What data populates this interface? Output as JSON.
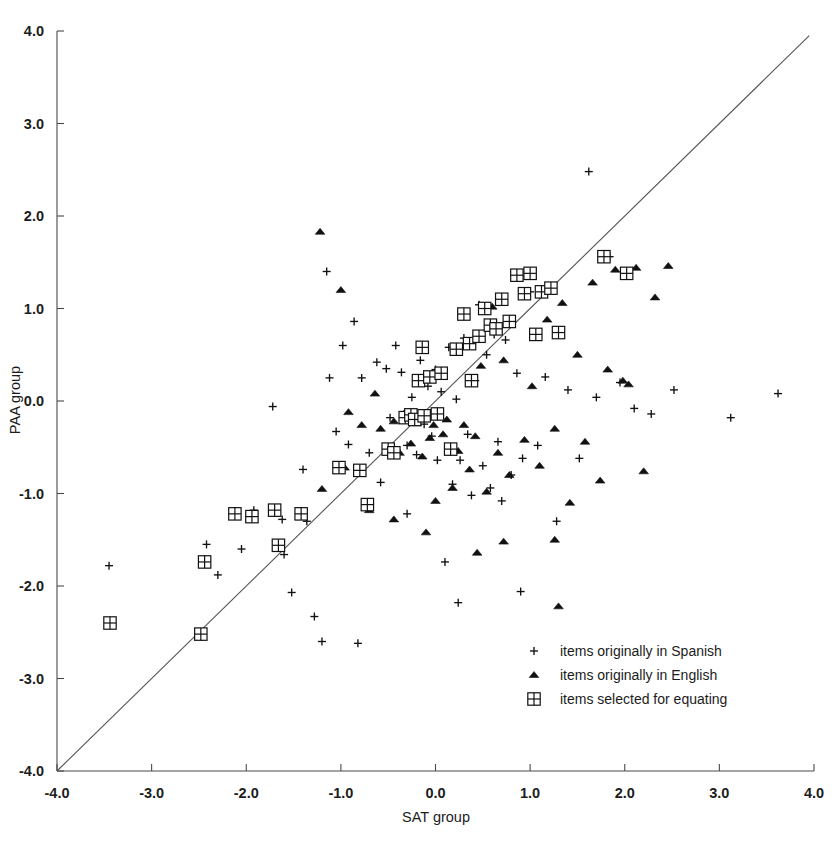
{
  "chart_data": {
    "type": "scatter",
    "title": "",
    "xlabel": "SAT group",
    "ylabel": "PAA group",
    "xlim": [
      -4.0,
      4.0
    ],
    "ylim": [
      -4.0,
      4.0
    ],
    "grid": false,
    "xticks": [
      "-4.0",
      "-3.0",
      "-2.0",
      "-1.0",
      "0.0",
      "1.0",
      "2.0",
      "3.0",
      "4.0"
    ],
    "xtick_values": [
      -4,
      -3,
      -2,
      -1,
      0,
      1,
      2,
      3,
      4
    ],
    "yticks": [
      "-4.0",
      "-3.0",
      "-2.0",
      "-1.0",
      "0.0",
      "1.0",
      "2.0",
      "3.0",
      "4.0"
    ],
    "ytick_values": [
      -4,
      -3,
      -2,
      -1,
      0,
      1,
      2,
      3,
      4
    ],
    "reference_line": {
      "name": "identity-line",
      "description": "y = x diagonal reference line",
      "from": [
        -4.0,
        -4.0
      ],
      "to": [
        3.95,
        3.95
      ]
    },
    "legend_position": "lower-right-inside",
    "series": [
      {
        "name": "items originally in Spanish",
        "marker": "plus",
        "points": [
          [
            -3.45,
            -1.78
          ],
          [
            -2.42,
            -1.55
          ],
          [
            -2.3,
            -1.88
          ],
          [
            -2.05,
            -1.6
          ],
          [
            -1.92,
            -1.18
          ],
          [
            -1.72,
            -0.06
          ],
          [
            -1.62,
            -1.28
          ],
          [
            -1.6,
            -1.66
          ],
          [
            -1.52,
            -2.07
          ],
          [
            -1.4,
            -0.74
          ],
          [
            -1.36,
            -1.3
          ],
          [
            -1.28,
            -2.33
          ],
          [
            -1.2,
            -2.6
          ],
          [
            -1.15,
            1.4
          ],
          [
            -1.12,
            0.25
          ],
          [
            -1.05,
            -0.33
          ],
          [
            -0.98,
            0.6
          ],
          [
            -0.92,
            -0.47
          ],
          [
            -0.86,
            0.86
          ],
          [
            -0.82,
            -2.62
          ],
          [
            -0.78,
            0.25
          ],
          [
            -0.7,
            -0.56
          ],
          [
            -0.62,
            0.42
          ],
          [
            -0.58,
            -0.88
          ],
          [
            -0.52,
            0.35
          ],
          [
            -0.48,
            -0.18
          ],
          [
            -0.42,
            0.6
          ],
          [
            -0.36,
            0.31
          ],
          [
            -0.3,
            -0.48
          ],
          [
            -0.25,
            0.04
          ],
          [
            -0.2,
            -0.58
          ],
          [
            -0.16,
            0.44
          ],
          [
            -0.12,
            -0.25
          ],
          [
            -0.08,
            0.16
          ],
          [
            -0.04,
            -0.38
          ],
          [
            0.0,
            0.34
          ],
          [
            0.02,
            -0.64
          ],
          [
            0.06,
            0.1
          ],
          [
            0.1,
            -1.74
          ],
          [
            0.14,
            0.58
          ],
          [
            0.18,
            -0.9
          ],
          [
            0.22,
            0.02
          ],
          [
            0.26,
            -0.64
          ],
          [
            0.3,
            0.68
          ],
          [
            0.34,
            -0.36
          ],
          [
            0.38,
            -1.02
          ],
          [
            0.42,
            0.22
          ],
          [
            0.46,
            1.04
          ],
          [
            0.5,
            -0.7
          ],
          [
            0.54,
            0.5
          ],
          [
            0.58,
            -0.94
          ],
          [
            0.62,
            0.72
          ],
          [
            0.66,
            -0.44
          ],
          [
            0.7,
            -1.08
          ],
          [
            0.74,
            0.66
          ],
          [
            0.8,
            -0.8
          ],
          [
            0.86,
            0.3
          ],
          [
            0.92,
            -0.62
          ],
          [
            1.0,
            1.18
          ],
          [
            1.08,
            -0.48
          ],
          [
            1.16,
            0.26
          ],
          [
            1.28,
            -1.3
          ],
          [
            1.4,
            0.12
          ],
          [
            1.52,
            -0.62
          ],
          [
            1.62,
            2.48
          ],
          [
            1.7,
            0.04
          ],
          [
            1.84,
            1.56
          ],
          [
            1.95,
            0.2
          ],
          [
            2.1,
            -0.08
          ],
          [
            2.28,
            -0.14
          ],
          [
            2.52,
            0.12
          ],
          [
            3.12,
            -0.18
          ],
          [
            3.62,
            0.08
          ],
          [
            0.9,
            -2.06
          ],
          [
            0.24,
            -2.18
          ],
          [
            -0.3,
            -1.22
          ]
        ]
      },
      {
        "name": "items originally in English",
        "marker": "triangle",
        "points": [
          [
            -1.22,
            1.83
          ],
          [
            -1.0,
            1.2
          ],
          [
            -0.92,
            -0.12
          ],
          [
            -0.78,
            -0.26
          ],
          [
            -0.64,
            0.08
          ],
          [
            -0.58,
            -0.3
          ],
          [
            -0.5,
            -0.5
          ],
          [
            -0.44,
            -0.22
          ],
          [
            -0.38,
            -0.56
          ],
          [
            -0.32,
            -0.12
          ],
          [
            -0.26,
            -0.46
          ],
          [
            -0.2,
            -0.24
          ],
          [
            -0.14,
            -0.6
          ],
          [
            -0.1,
            -0.18
          ],
          [
            -0.06,
            -0.4
          ],
          [
            -0.02,
            -0.26
          ],
          [
            0.04,
            -0.16
          ],
          [
            0.08,
            -0.36
          ],
          [
            0.12,
            -0.2
          ],
          [
            0.18,
            -0.94
          ],
          [
            0.24,
            -0.54
          ],
          [
            0.3,
            -0.26
          ],
          [
            0.36,
            -0.74
          ],
          [
            0.42,
            -0.38
          ],
          [
            0.48,
            0.38
          ],
          [
            0.54,
            -0.98
          ],
          [
            0.6,
            1.02
          ],
          [
            0.66,
            -0.56
          ],
          [
            0.72,
            0.44
          ],
          [
            0.78,
            -0.8
          ],
          [
            0.86,
            1.34
          ],
          [
            0.94,
            -0.42
          ],
          [
            1.02,
            0.16
          ],
          [
            1.1,
            -0.7
          ],
          [
            1.18,
            0.88
          ],
          [
            1.26,
            -0.3
          ],
          [
            1.34,
            1.06
          ],
          [
            1.42,
            -1.1
          ],
          [
            1.5,
            0.5
          ],
          [
            1.58,
            -0.44
          ],
          [
            1.66,
            1.28
          ],
          [
            1.74,
            -0.86
          ],
          [
            1.82,
            0.34
          ],
          [
            1.9,
            1.42
          ],
          [
            1.98,
            0.22
          ],
          [
            2.04,
            0.18
          ],
          [
            2.12,
            1.44
          ],
          [
            2.2,
            -0.76
          ],
          [
            2.32,
            1.12
          ],
          [
            2.46,
            1.46
          ],
          [
            1.3,
            -2.22
          ],
          [
            1.26,
            -1.5
          ],
          [
            0.72,
            -1.52
          ],
          [
            0.44,
            -1.64
          ],
          [
            -0.1,
            -1.42
          ],
          [
            -0.44,
            -1.28
          ],
          [
            -0.7,
            -1.18
          ],
          [
            0.0,
            -1.08
          ],
          [
            -1.2,
            -0.95
          ],
          [
            -0.96,
            -0.72
          ]
        ]
      },
      {
        "name": "items selected for equating",
        "marker": "square-cross",
        "points": [
          [
            -3.44,
            -2.4
          ],
          [
            -2.48,
            -2.52
          ],
          [
            -2.44,
            -1.74
          ],
          [
            -2.12,
            -1.22
          ],
          [
            -1.94,
            -1.25
          ],
          [
            -1.7,
            -1.18
          ],
          [
            -1.66,
            -1.56
          ],
          [
            -1.42,
            -1.22
          ],
          [
            -1.02,
            -0.72
          ],
          [
            -0.8,
            -0.75
          ],
          [
            -0.72,
            -1.12
          ],
          [
            -0.5,
            -0.52
          ],
          [
            -0.44,
            -0.56
          ],
          [
            -0.32,
            -0.18
          ],
          [
            -0.26,
            -0.15
          ],
          [
            -0.22,
            -0.2
          ],
          [
            -0.18,
            0.22
          ],
          [
            -0.12,
            -0.16
          ],
          [
            -0.06,
            0.26
          ],
          [
            0.02,
            -0.14
          ],
          [
            0.06,
            0.3
          ],
          [
            0.22,
            0.56
          ],
          [
            0.3,
            0.94
          ],
          [
            0.36,
            0.62
          ],
          [
            0.46,
            0.7
          ],
          [
            0.52,
            1.0
          ],
          [
            0.58,
            0.82
          ],
          [
            0.64,
            0.78
          ],
          [
            0.7,
            1.1
          ],
          [
            0.78,
            0.86
          ],
          [
            0.86,
            1.36
          ],
          [
            0.94,
            1.16
          ],
          [
            1.0,
            1.38
          ],
          [
            1.06,
            0.72
          ],
          [
            1.12,
            1.18
          ],
          [
            1.22,
            1.22
          ],
          [
            1.3,
            0.74
          ],
          [
            1.78,
            1.56
          ],
          [
            2.02,
            1.38
          ],
          [
            0.38,
            0.22
          ],
          [
            -0.14,
            0.58
          ],
          [
            0.16,
            -0.52
          ]
        ]
      }
    ]
  },
  "legend": {
    "entries": [
      {
        "marker": "plus",
        "label": "items originally in Spanish"
      },
      {
        "marker": "triangle",
        "label": "items originally in English"
      },
      {
        "marker": "square-cross",
        "label": "items selected for equating"
      }
    ]
  },
  "colors": {
    "background": "#ffffff",
    "ink": "#111111",
    "axis": "#4a4a4a",
    "line": "#555555"
  }
}
